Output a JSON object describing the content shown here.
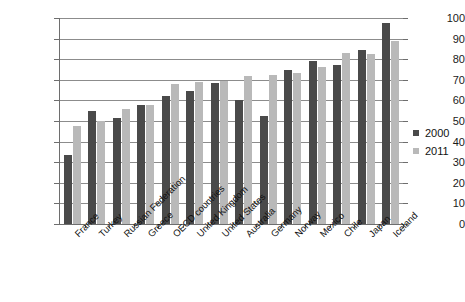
{
  "chart_data": {
    "type": "bar",
    "title": "",
    "subtitle": "",
    "xlabel": "",
    "ylabel": "",
    "ylim": [
      0,
      100
    ],
    "ytick_labels": [
      "0",
      "10",
      "20",
      "30",
      "40",
      "50",
      "60",
      "70",
      "80",
      "90",
      "100"
    ],
    "yticks": [
      0,
      10,
      20,
      30,
      40,
      50,
      60,
      70,
      80,
      90,
      100
    ],
    "grid": true,
    "legend_position": "right",
    "categories": [
      "France",
      "Turkey",
      "Russian Federation",
      "Greece",
      "OECD countries",
      "United Kingdom",
      "United States",
      "Australia",
      "Germany",
      "Norway",
      "Mexico",
      "Chile",
      "Japan",
      "Iceland"
    ],
    "series": [
      {
        "name": "2000",
        "color": "#4a4a4a",
        "values": [
          33.5,
          54.7,
          51.3,
          58.0,
          62.0,
          64.6,
          68.4,
          60.4,
          52.5,
          75.0,
          79.3,
          77.2,
          84.4,
          97.5
        ]
      },
      {
        "name": "2011",
        "color": "#b9b9b9",
        "values": [
          47.5,
          49.8,
          55.8,
          57.7,
          68.2,
          68.8,
          69.2,
          72.0,
          72.3,
          73.1,
          76.2,
          82.8,
          82.5,
          89.0
        ]
      }
    ]
  },
  "legend": {
    "entries": [
      {
        "label": "2000",
        "swatch": "s2000"
      },
      {
        "label": "2011",
        "swatch": "s2011"
      }
    ]
  }
}
